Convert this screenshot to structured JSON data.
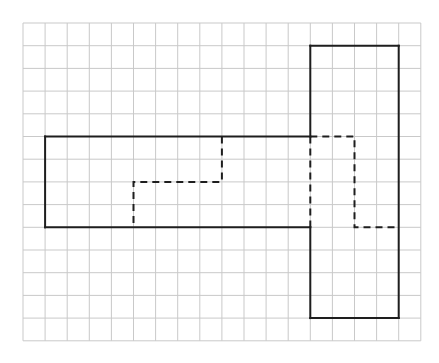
{
  "diagram": {
    "type": "grid-figure",
    "grid": {
      "cols": 18,
      "rows": 14,
      "origin_x": 23,
      "origin_y": 23,
      "cell_w": 22.1,
      "cell_h": 22.7,
      "line_color": "#c9c9c9"
    },
    "shape": {
      "stroke_color": "#1e1e1e",
      "stroke_width": 2,
      "outline_solid": [
        [
          [
            1,
            5
          ],
          [
            13,
            5
          ]
        ],
        [
          [
            13,
            5
          ],
          [
            13,
            1
          ]
        ],
        [
          [
            13,
            1
          ],
          [
            17,
            1
          ]
        ],
        [
          [
            17,
            1
          ],
          [
            17,
            13
          ]
        ],
        [
          [
            17,
            13
          ],
          [
            13,
            13
          ]
        ],
        [
          [
            13,
            13
          ],
          [
            13,
            9
          ]
        ],
        [
          [
            13,
            9
          ],
          [
            1,
            9
          ]
        ],
        [
          [
            1,
            9
          ],
          [
            1,
            5
          ]
        ]
      ],
      "dashed": [
        [
          [
            9,
            5
          ],
          [
            9,
            7
          ],
          [
            5,
            7
          ],
          [
            5,
            9
          ]
        ],
        [
          [
            13,
            5
          ],
          [
            13,
            9
          ]
        ],
        [
          [
            13,
            5
          ],
          [
            15,
            5
          ],
          [
            15,
            9
          ],
          [
            17,
            9
          ]
        ]
      ]
    }
  }
}
